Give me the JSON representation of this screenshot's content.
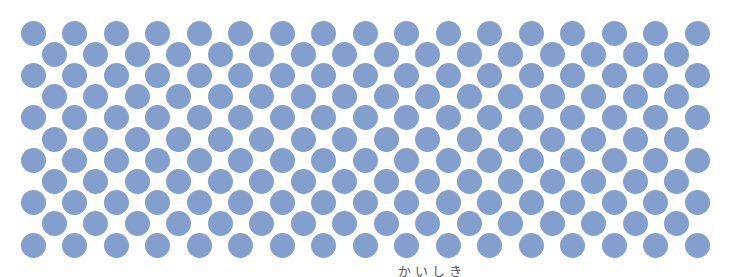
{
  "pattern": {
    "type": "staggered-dot-grid",
    "dot_color": "#829fce",
    "background_color": "#ffffff",
    "dot_diameter": 25,
    "rows": 11,
    "row_start_y": 33,
    "row_step_y": 21.2,
    "even_rows": {
      "count": 17,
      "start_x": 33,
      "step_x": 41.5
    },
    "odd_rows": {
      "count": 16,
      "start_x": 54,
      "step_x": 41.5
    }
  },
  "caption": {
    "text": "かいしき"
  }
}
